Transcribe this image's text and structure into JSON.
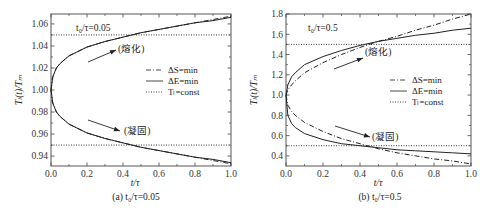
{
  "chart_data": [
    {
      "type": "line",
      "panel": "a",
      "caption": "(a) t₀/τ=0.05",
      "annotation": "t₀/τ=0.05",
      "xlabel": "t/τ",
      "ylabel": "Tₗ(t)/Tₘ",
      "xlim": [
        0.0,
        1.0
      ],
      "ylim": [
        0.931,
        1.069
      ],
      "xticks": [
        "0.0",
        "0.2",
        "0.4",
        "0.6",
        "0.8",
        "1.0"
      ],
      "yticks": [
        "0.94",
        "0.96",
        "0.98",
        "1.00",
        "1.02",
        "1.04",
        "1.06"
      ],
      "grid": false,
      "legend_position": "right-middle",
      "legend": [
        "ΔS=min",
        "ΔE=min",
        "Tₗ=const"
      ],
      "labels": {
        "melting": "(熔化)",
        "solidification": "(凝固)"
      },
      "x": [
        0.0,
        0.01,
        0.03,
        0.05,
        0.1,
        0.2,
        0.3,
        0.4,
        0.5,
        0.6,
        0.7,
        0.8,
        0.9,
        1.0
      ],
      "series": [
        {
          "name": "ΔS=min (melting)",
          "style": "dash-dot",
          "values": [
            1.0,
            1.012,
            1.02,
            1.024,
            1.031,
            1.039,
            1.044,
            1.048,
            1.052,
            1.055,
            1.058,
            1.061,
            1.064,
            1.067
          ]
        },
        {
          "name": "ΔE=min (melting)",
          "style": "solid",
          "values": [
            1.0,
            1.012,
            1.02,
            1.024,
            1.031,
            1.039,
            1.044,
            1.048,
            1.052,
            1.055,
            1.058,
            1.061,
            1.063,
            1.066
          ]
        },
        {
          "name": "ΔS=min (solidification)",
          "style": "dash-dot",
          "values": [
            1.0,
            0.988,
            0.98,
            0.976,
            0.969,
            0.961,
            0.956,
            0.952,
            0.948,
            0.945,
            0.942,
            0.939,
            0.936,
            0.933
          ]
        },
        {
          "name": "ΔE=min (solidification)",
          "style": "solid",
          "values": [
            1.0,
            0.988,
            0.98,
            0.976,
            0.969,
            0.961,
            0.956,
            0.952,
            0.948,
            0.945,
            0.942,
            0.939,
            0.937,
            0.934
          ]
        },
        {
          "name": "Tₗ=const (melting)",
          "style": "dotted",
          "values": [
            1.05,
            1.05,
            1.05,
            1.05,
            1.05,
            1.05,
            1.05,
            1.05,
            1.05,
            1.05,
            1.05,
            1.05,
            1.05,
            1.05
          ]
        },
        {
          "name": "Tₗ=const (solidification)",
          "style": "dotted",
          "values": [
            0.95,
            0.95,
            0.95,
            0.95,
            0.95,
            0.95,
            0.95,
            0.95,
            0.95,
            0.95,
            0.95,
            0.95,
            0.95,
            0.95
          ]
        }
      ]
    },
    {
      "type": "line",
      "panel": "b",
      "caption": "(b) t₀/τ=0.5",
      "annotation": "t₀/τ=0.5",
      "xlabel": "t/τ",
      "ylabel": "Tₗ(t)/Tₘ",
      "xlim": [
        0.0,
        1.0
      ],
      "ylim": [
        0.3,
        1.8
      ],
      "xticks": [
        "0.0",
        "0.2",
        "0.4",
        "0.6",
        "0.8",
        "1.0"
      ],
      "yticks": [
        "0.4",
        "0.6",
        "0.8",
        "1.0",
        "1.2",
        "1.4",
        "1.6",
        "1.8"
      ],
      "grid": false,
      "legend_position": "right-middle",
      "legend": [
        "ΔS=min",
        "ΔE=min",
        "Tₗ=const"
      ],
      "labels": {
        "melting": "(熔化)",
        "solidification": "(凝固)"
      },
      "x": [
        0.0,
        0.01,
        0.03,
        0.05,
        0.1,
        0.2,
        0.3,
        0.4,
        0.5,
        0.6,
        0.7,
        0.8,
        0.9,
        1.0
      ],
      "series": [
        {
          "name": "ΔS=min (melting)",
          "style": "dash-dot",
          "values": [
            1.0,
            1.05,
            1.1,
            1.14,
            1.22,
            1.32,
            1.4,
            1.47,
            1.53,
            1.58,
            1.64,
            1.69,
            1.75,
            1.8
          ]
        },
        {
          "name": "ΔE=min (melting)",
          "style": "solid",
          "values": [
            1.0,
            1.1,
            1.18,
            1.22,
            1.3,
            1.38,
            1.44,
            1.49,
            1.53,
            1.56,
            1.59,
            1.61,
            1.64,
            1.66
          ]
        },
        {
          "name": "ΔS=min (solidification)",
          "style": "dash-dot",
          "values": [
            1.0,
            0.9,
            0.84,
            0.8,
            0.73,
            0.64,
            0.57,
            0.52,
            0.47,
            0.43,
            0.4,
            0.37,
            0.35,
            0.32
          ]
        },
        {
          "name": "ΔE=min (solidification)",
          "style": "solid",
          "values": [
            1.0,
            0.8,
            0.72,
            0.68,
            0.62,
            0.56,
            0.52,
            0.5,
            0.48,
            0.46,
            0.45,
            0.44,
            0.43,
            0.42
          ]
        },
        {
          "name": "Tₗ=const (melting)",
          "style": "dotted",
          "values": [
            1.5,
            1.5,
            1.5,
            1.5,
            1.5,
            1.5,
            1.5,
            1.5,
            1.5,
            1.5,
            1.5,
            1.5,
            1.5,
            1.5
          ]
        },
        {
          "name": "Tₗ=const (solidification)",
          "style": "dotted",
          "values": [
            0.5,
            0.5,
            0.5,
            0.5,
            0.5,
            0.5,
            0.5,
            0.5,
            0.5,
            0.5,
            0.5,
            0.5,
            0.5,
            0.5
          ]
        }
      ]
    }
  ],
  "text": {
    "a": {
      "annotation": "t₀/τ=0.05",
      "melting": "(熔化)",
      "solidification": "(凝固)",
      "xlabel": "t/τ",
      "ylabel": "Tₗ(t)/Tₘ",
      "caption": "(a) t₀/τ=0.05",
      "legend": [
        "ΔS=min",
        "ΔE=min",
        "Tₗ=const"
      ]
    },
    "b": {
      "annotation": "t₀/τ=0.5",
      "melting": "(熔化)",
      "solidification": "(凝固)",
      "xlabel": "t/τ",
      "ylabel": "Tₗ(t)/Tₘ",
      "caption": "(b) t₀/τ=0.5",
      "legend": [
        "ΔS=min",
        "ΔE=min",
        "Tₗ=const"
      ]
    }
  }
}
